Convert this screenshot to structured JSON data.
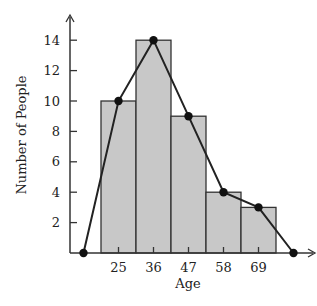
{
  "chart_data": {
    "type": "bar",
    "subtype": "histogram-with-frequency-polygon",
    "title": "",
    "xlabel": "Age",
    "ylabel": "Number of People",
    "categories": [
      "25",
      "36",
      "47",
      "58",
      "69"
    ],
    "values": [
      10,
      14,
      9,
      4,
      3
    ],
    "series": [
      {
        "name": "Histogram",
        "type": "bar",
        "values": [
          10,
          14,
          9,
          4,
          3
        ]
      },
      {
        "name": "Frequency Polygon",
        "type": "line",
        "x": [
          14,
          25,
          36,
          47,
          58,
          69,
          80
        ],
        "values": [
          0,
          10,
          14,
          9,
          4,
          3,
          0
        ]
      }
    ],
    "yticks": [
      "2",
      "4",
      "6",
      "8",
      "10",
      "12",
      "14"
    ],
    "ylim": [
      0,
      15
    ],
    "grid": false,
    "legend": null,
    "colors": {
      "bar_fill": "#c8c8c8",
      "bar_stroke": "#333333",
      "line": "#222222",
      "axis": "#333333"
    }
  }
}
